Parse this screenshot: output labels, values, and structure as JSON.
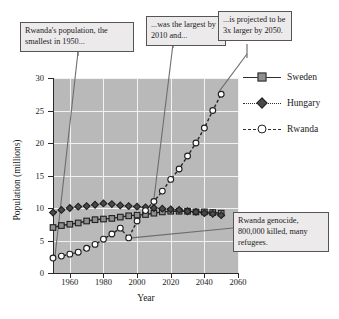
{
  "chart_data": {
    "type": "line",
    "title": "",
    "xlabel": "Year",
    "ylabel": "Population (millions)",
    "xlim": [
      1950,
      2060
    ],
    "ylim": [
      0,
      30
    ],
    "xticks": [
      1960,
      1980,
      2000,
      2020,
      2040,
      2060
    ],
    "yticks": [
      0,
      5,
      10,
      15,
      20,
      25,
      30
    ],
    "grid": true,
    "legend_position": "right",
    "series": [
      {
        "name": "Sweden",
        "marker": "filled-square",
        "linestyle": "solid",
        "x": [
          1950,
          1955,
          1960,
          1965,
          1970,
          1975,
          1980,
          1985,
          1990,
          1995,
          2000,
          2005,
          2010,
          2015,
          2020,
          2025,
          2030,
          2035,
          2040,
          2045,
          2050
        ],
        "values": [
          7.0,
          7.3,
          7.5,
          7.7,
          8.0,
          8.2,
          8.3,
          8.4,
          8.6,
          8.8,
          8.9,
          9.0,
          9.2,
          9.4,
          9.5,
          9.5,
          9.5,
          9.4,
          9.4,
          9.3,
          9.2
        ]
      },
      {
        "name": "Hungary",
        "marker": "filled-diamond",
        "linestyle": "dotted",
        "x": [
          1950,
          1955,
          1960,
          1965,
          1970,
          1975,
          1980,
          1985,
          1990,
          1995,
          2000,
          2005,
          2010,
          2015,
          2020,
          2025,
          2030,
          2035,
          2040,
          2045,
          2050
        ],
        "values": [
          9.3,
          9.7,
          10.0,
          10.2,
          10.3,
          10.5,
          10.7,
          10.6,
          10.4,
          10.3,
          10.2,
          10.1,
          10.0,
          9.9,
          9.8,
          9.7,
          9.5,
          9.4,
          9.2,
          9.1,
          8.9
        ]
      },
      {
        "name": "Rwanda",
        "marker": "open-circle",
        "linestyle": "dashed",
        "x": [
          1950,
          1955,
          1960,
          1965,
          1970,
          1975,
          1980,
          1985,
          1990,
          1995,
          2000,
          2005,
          2010,
          2015,
          2020,
          2025,
          2030,
          2035,
          2040,
          2045,
          2050
        ],
        "values": [
          2.3,
          2.6,
          2.9,
          3.2,
          3.8,
          4.4,
          5.2,
          6.0,
          6.9,
          5.4,
          8.0,
          9.6,
          11.0,
          12.6,
          14.4,
          16.0,
          18.0,
          20.0,
          22.3,
          25.0,
          27.5
        ]
      }
    ]
  },
  "legend": {
    "items": [
      {
        "label": "Sweden"
      },
      {
        "label": "Hungary"
      },
      {
        "label": "Rwanda"
      }
    ]
  },
  "axes": {
    "x_title": "Year",
    "y_title": "Population (millions)",
    "x_tick_labels": [
      "1960",
      "1980",
      "2000",
      "2020",
      "2040",
      "2060"
    ],
    "y_tick_labels": [
      "0",
      "5",
      "10",
      "15",
      "20",
      "25",
      "30"
    ]
  },
  "callouts": [
    {
      "id": "callout-0",
      "text": "Rwanda's population, the smallest in 1950..."
    },
    {
      "id": "callout-1",
      "text": "...was the largest by 2010 and..."
    },
    {
      "id": "callout-2",
      "text": "...is projected to be 3x larger by 2050."
    },
    {
      "id": "callout-3",
      "text": "Rwanda genocide, 800,000 killed, many refugees."
    }
  ],
  "colors": {
    "plot_background": "#b9b9b9",
    "gridline": "#f2f2f2",
    "axis": "#2a2a2a",
    "callout_background": "#eceaea",
    "callout_border": "#555555",
    "sweden_marker": "#8f8f8f",
    "hungary_marker": "#4a4a4a",
    "rwanda_marker": "#ffffff"
  }
}
